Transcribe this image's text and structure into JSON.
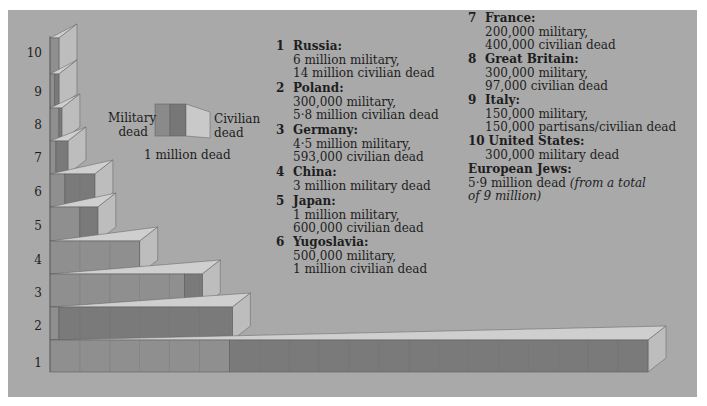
{
  "chart_data": {
    "type": "bar",
    "orientation": "horizontal",
    "stacked": true,
    "title": "",
    "xlabel": "",
    "ylabel": "",
    "unit": "1 block = 1 million dead",
    "categories": [
      "1",
      "2",
      "3",
      "4",
      "5",
      "6",
      "7",
      "8",
      "9",
      "10"
    ],
    "countries": [
      "Russia",
      "Poland",
      "Germany",
      "China",
      "Japan",
      "Yugoslavia",
      "France",
      "Great Britain",
      "Italy",
      "United States"
    ],
    "series": [
      {
        "name": "Military dead",
        "color": "#8f8f8f",
        "values": [
          6,
          0.3,
          4.5,
          3,
          1,
          0.5,
          0.2,
          0.3,
          0.15,
          0.3
        ]
      },
      {
        "name": "Civilian dead",
        "color": "#7a7a7a",
        "values": [
          14,
          5.8,
          0.593,
          0,
          0.6,
          1,
          0.4,
          0.097,
          0.15,
          0
        ]
      }
    ],
    "legend": {
      "military": "Military dead",
      "civilian": "Civilian dead",
      "scale": "1 million dead"
    },
    "grid": false
  },
  "yaxis": {
    "labels": [
      "1",
      "2",
      "3",
      "4",
      "5",
      "6",
      "7",
      "8",
      "9",
      "10"
    ]
  },
  "legend": {
    "military_label_line1": "Military",
    "military_label_line2": "dead",
    "civilian_label_line1": "Civilian",
    "civilian_label_line2": "dead",
    "scale_label": "1 million dead"
  },
  "entries": [
    {
      "num": "1",
      "name": "Russia:",
      "lines": [
        "6 million military,",
        "14 million civilian dead"
      ]
    },
    {
      "num": "2",
      "name": "Poland:",
      "lines": [
        "300,000 military,",
        "5·8 million civilian dead"
      ]
    },
    {
      "num": "3",
      "name": "Germany:",
      "lines": [
        "4·5 million military,",
        "593,000 civilian dead"
      ]
    },
    {
      "num": "4",
      "name": "China:",
      "lines": [
        "3 million military dead"
      ]
    },
    {
      "num": "5",
      "name": "Japan:",
      "lines": [
        "1 million military,",
        "600,000 civilian dead"
      ]
    },
    {
      "num": "6",
      "name": "Yugoslavia:",
      "lines": [
        "500,000 military,",
        "1 million civilian dead"
      ]
    },
    {
      "num": "7",
      "name": "France:",
      "lines": [
        "200,000 military,",
        "400,000 civilian dead"
      ]
    },
    {
      "num": "8",
      "name": "Great Britain:",
      "lines": [
        "300,000 military,",
        "97,000 civilian dead"
      ]
    },
    {
      "num": "9",
      "name": "Italy:",
      "lines": [
        "150,000 military,",
        "150,000 partisans/civilian dead"
      ]
    },
    {
      "num": "10",
      "name": "United States:",
      "lines": [
        "300,000 military dead"
      ]
    }
  ],
  "jews": {
    "name": "European Jews:",
    "line1": "5·9 million dead ",
    "line1_italic": "(from a total",
    "line2_italic": "of 9 million)"
  },
  "colors": {
    "panel": "#a9a9a9",
    "military": "#8f8f8f",
    "civilian": "#7a7a7a",
    "top_face": "#cfcfcf",
    "end_face": "#bdbdbd",
    "outline": "#5e5e5e"
  }
}
